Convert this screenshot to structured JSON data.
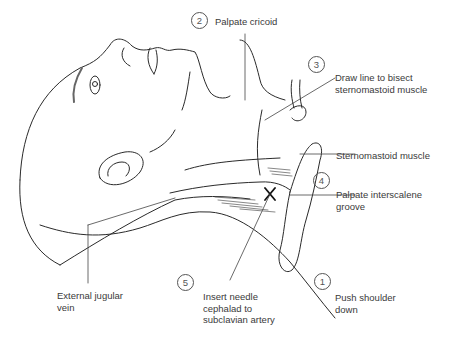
{
  "figure": {
    "steps": [
      {
        "number": "1",
        "text": "Push shoulder\ndown"
      },
      {
        "number": "2",
        "text": "Palpate cricoid"
      },
      {
        "number": "3",
        "text": "Draw line to bisect\nsternomastoid muscle"
      },
      {
        "number": "4",
        "text": "Palpate interscalene\ngroove"
      },
      {
        "number": "5",
        "text": "Insert needle\ncephalad to\nsubclavian artery"
      }
    ],
    "anatomy_labels": [
      {
        "text": "Sternomastoid muscle"
      },
      {
        "text": "External jugular\nvein"
      }
    ],
    "marker": {
      "symbol": "X",
      "meaning": "needle insertion point"
    },
    "colors": {
      "line": "#2a2a2a",
      "text": "#3a3a3a",
      "background": "#ffffff"
    }
  }
}
